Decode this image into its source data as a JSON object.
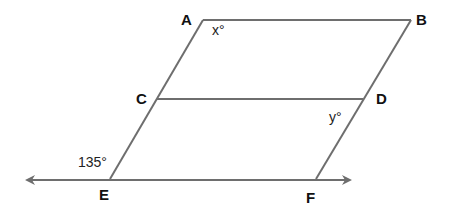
{
  "figure": {
    "type": "geometry-diagram",
    "line_color": "#6e6e6e",
    "text_color": "#111111",
    "background": "#ffffff"
  },
  "points": {
    "A": {
      "label": "A",
      "x": 203,
      "y": 20,
      "label_x": 181,
      "label_y": 25
    },
    "B": {
      "label": "B",
      "x": 411,
      "y": 20,
      "label_x": 416,
      "label_y": 25
    },
    "C": {
      "label": "C",
      "x": 157,
      "y": 99,
      "label_x": 136,
      "label_y": 104
    },
    "D": {
      "label": "D",
      "x": 363,
      "y": 99,
      "label_x": 376,
      "label_y": 104
    },
    "E": {
      "label": "E",
      "x": 110,
      "y": 179,
      "label_x": 99,
      "label_y": 200
    },
    "F": {
      "label": "F",
      "x": 316,
      "y": 179,
      "label_x": 306,
      "label_y": 203
    }
  },
  "segments": [
    {
      "name": "AB",
      "from": "A",
      "to": "B"
    },
    {
      "name": "AE",
      "from": "A",
      "to": "E"
    },
    {
      "name": "BF",
      "from": "B",
      "to": "F"
    },
    {
      "name": "CD",
      "from": "C",
      "to": "D"
    }
  ],
  "line_EF": {
    "x1": 27,
    "y1": 180,
    "x2": 350,
    "y2": 180,
    "arrows": "both"
  },
  "angle_labels": {
    "x": {
      "text": "x°",
      "x": 212,
      "y": 35
    },
    "y": {
      "text": "y°",
      "x": 329,
      "y": 122
    },
    "e": {
      "text": "135°",
      "x": 78,
      "y": 167
    }
  }
}
